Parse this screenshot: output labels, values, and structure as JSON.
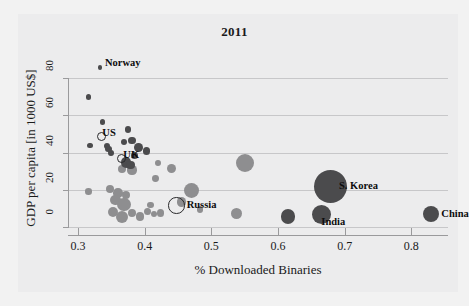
{
  "chart_data": {
    "type": "scatter",
    "title": "2011",
    "xlabel": "% Downloaded Binaries",
    "ylabel": "GDP per capita [in 1000 US$]",
    "xlim": [
      0.285,
      0.855
    ],
    "ylim": [
      0,
      88
    ],
    "xticks": [
      0.3,
      0.4,
      0.5,
      0.6,
      0.7,
      0.8
    ],
    "xtick_labels": [
      "0.3",
      "0.4",
      "0.5",
      "0.6",
      "0.7",
      "0.8"
    ],
    "yticks": [
      0,
      20,
      40,
      60,
      80
    ],
    "ytick_labels": [
      "0",
      "20",
      "40",
      "60",
      "80"
    ],
    "grid": "horizontal",
    "legend": "none",
    "bubble_size_meaning": "population",
    "colors": {
      "light_bubble": "#8e8e90",
      "dark_bubble": "#4b4b4d",
      "hollow_outline": "#2a2a2c",
      "gridline": "#c7c7c9",
      "axis": "#9a9a9c",
      "background": "#ececed",
      "text": "#1a1a1a"
    },
    "annotations": [
      {
        "label": "Norway",
        "x": 0.333,
        "y": 85.5
      },
      {
        "label": "US",
        "x": 0.335,
        "y": 48.5
      },
      {
        "label": "UK",
        "x": 0.365,
        "y": 37.0
      },
      {
        "label": "Russia",
        "x": 0.448,
        "y": 11.5
      },
      {
        "label": "S. Korea",
        "x": 0.678,
        "y": 22.0
      },
      {
        "label": "India",
        "x": 0.665,
        "y": 6.5
      },
      {
        "label": "China",
        "x": 0.83,
        "y": 7.0
      }
    ],
    "points": [
      {
        "x": 0.333,
        "y": 85.5,
        "r": 2.4,
        "style": "dark",
        "label": "Norway"
      },
      {
        "x": 0.316,
        "y": 69.8,
        "r": 2.6,
        "style": "dark"
      },
      {
        "x": 0.337,
        "y": 56.5,
        "r": 2.8,
        "style": "dark"
      },
      {
        "x": 0.375,
        "y": 52.3,
        "r": 3.2,
        "style": "dark"
      },
      {
        "x": 0.335,
        "y": 48.5,
        "r": 4.6,
        "style": "hollow",
        "label": "US"
      },
      {
        "x": 0.381,
        "y": 46.4,
        "r": 3.9,
        "style": "dark"
      },
      {
        "x": 0.369,
        "y": 45.6,
        "r": 3.0,
        "style": "dark"
      },
      {
        "x": 0.318,
        "y": 43.8,
        "r": 2.7,
        "style": "dark"
      },
      {
        "x": 0.343,
        "y": 43.4,
        "r": 3.0,
        "style": "dark"
      },
      {
        "x": 0.346,
        "y": 41.8,
        "r": 3.2,
        "style": "dark"
      },
      {
        "x": 0.391,
        "y": 42.8,
        "r": 4.4,
        "style": "dark"
      },
      {
        "x": 0.403,
        "y": 40.8,
        "r": 3.6,
        "style": "dark"
      },
      {
        "x": 0.349,
        "y": 39.6,
        "r": 2.9,
        "style": "dark"
      },
      {
        "x": 0.365,
        "y": 37.0,
        "r": 4.5,
        "style": "hollow",
        "label": "UK"
      },
      {
        "x": 0.385,
        "y": 38.3,
        "r": 3.8,
        "style": "dark"
      },
      {
        "x": 0.372,
        "y": 34.8,
        "r": 5.4,
        "style": "dark"
      },
      {
        "x": 0.379,
        "y": 33.2,
        "r": 4.2,
        "style": "dark"
      },
      {
        "x": 0.366,
        "y": 31.4,
        "r": 4.0,
        "style": "light"
      },
      {
        "x": 0.381,
        "y": 30.6,
        "r": 4.6,
        "style": "light"
      },
      {
        "x": 0.42,
        "y": 34.2,
        "r": 2.9,
        "style": "light"
      },
      {
        "x": 0.44,
        "y": 31.2,
        "r": 4.5,
        "style": "light"
      },
      {
        "x": 0.416,
        "y": 26.0,
        "r": 3.4,
        "style": "light"
      },
      {
        "x": 0.55,
        "y": 34.3,
        "r": 9.0,
        "style": "light"
      },
      {
        "x": 0.316,
        "y": 19.1,
        "r": 3.3,
        "style": "light"
      },
      {
        "x": 0.348,
        "y": 20.5,
        "r": 4.2,
        "style": "light"
      },
      {
        "x": 0.36,
        "y": 18.4,
        "r": 4.8,
        "style": "light"
      },
      {
        "x": 0.372,
        "y": 17.2,
        "r": 4.2,
        "style": "light"
      },
      {
        "x": 0.356,
        "y": 14.6,
        "r": 5.2,
        "style": "light"
      },
      {
        "x": 0.369,
        "y": 12.0,
        "r": 6.8,
        "style": "light"
      },
      {
        "x": 0.352,
        "y": 8.3,
        "r": 5.0,
        "style": "light"
      },
      {
        "x": 0.366,
        "y": 5.4,
        "r": 6.3,
        "style": "light"
      },
      {
        "x": 0.381,
        "y": 7.4,
        "r": 4.0,
        "style": "light"
      },
      {
        "x": 0.393,
        "y": 5.6,
        "r": 4.3,
        "style": "light"
      },
      {
        "x": 0.404,
        "y": 8.2,
        "r": 3.5,
        "style": "light"
      },
      {
        "x": 0.409,
        "y": 11.8,
        "r": 3.2,
        "style": "light"
      },
      {
        "x": 0.414,
        "y": 6.8,
        "r": 3.0,
        "style": "light"
      },
      {
        "x": 0.424,
        "y": 7.6,
        "r": 3.7,
        "style": "light"
      },
      {
        "x": 0.47,
        "y": 19.8,
        "r": 7.4,
        "style": "light"
      },
      {
        "x": 0.455,
        "y": 13.4,
        "r": 4.6,
        "style": "light"
      },
      {
        "x": 0.448,
        "y": 11.5,
        "r": 8.2,
        "style": "hollow",
        "label": "Russia"
      },
      {
        "x": 0.483,
        "y": 9.5,
        "r": 3.4,
        "style": "light"
      },
      {
        "x": 0.538,
        "y": 7.3,
        "r": 5.6,
        "style": "light"
      },
      {
        "x": 0.615,
        "y": 5.6,
        "r": 7.4,
        "style": "dark"
      },
      {
        "x": 0.665,
        "y": 6.5,
        "r": 9.6,
        "style": "dark",
        "label": "India"
      },
      {
        "x": 0.678,
        "y": 22.0,
        "r": 16.5,
        "style": "dark",
        "label": "S. Korea"
      },
      {
        "x": 0.83,
        "y": 7.0,
        "r": 8.0,
        "style": "dark",
        "label": "China"
      }
    ]
  }
}
